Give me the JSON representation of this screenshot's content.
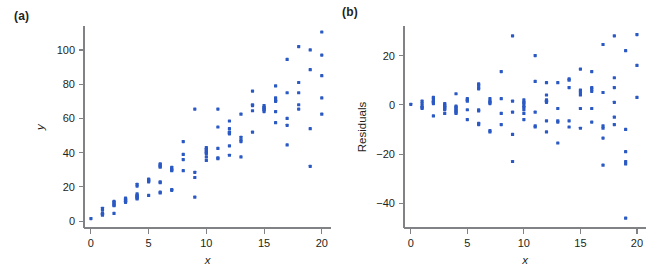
{
  "figure": {
    "background": "#ffffff",
    "marker_color": "#2b59c3",
    "axis_color": "#808285",
    "text_color": "#231f20"
  },
  "panels": [
    {
      "id": "a",
      "label": "(a)",
      "xlabel": "x",
      "ylabel": "y"
    },
    {
      "id": "b",
      "label": "(b)",
      "xlabel": "x",
      "ylabel": "Residuals"
    }
  ],
  "chart_data": [
    {
      "type": "scatter",
      "panel": "(a)",
      "title": "",
      "xlabel": "x",
      "ylabel": "y",
      "xlim": [
        -0.6,
        20.8
      ],
      "ylim": [
        -4,
        114
      ],
      "xticks": [
        0,
        5,
        10,
        15,
        20
      ],
      "yticks": [
        0,
        20,
        40,
        60,
        80,
        100
      ],
      "grid": false,
      "legend": null,
      "points": [
        [
          0,
          1.5
        ],
        [
          1,
          7.5
        ],
        [
          1,
          6.5
        ],
        [
          1,
          4.5
        ],
        [
          1,
          4.0
        ],
        [
          1,
          3.5
        ],
        [
          2,
          11.5
        ],
        [
          2,
          11.0
        ],
        [
          2,
          10.0
        ],
        [
          2,
          9.5
        ],
        [
          2,
          9.0
        ],
        [
          2,
          4.5
        ],
        [
          3,
          13.5
        ],
        [
          3,
          13.0
        ],
        [
          3,
          12.5
        ],
        [
          3,
          12.0
        ],
        [
          3,
          11.5
        ],
        [
          3,
          11.0
        ],
        [
          4,
          21.5
        ],
        [
          4,
          20.5
        ],
        [
          4,
          16.0
        ],
        [
          4,
          15.0
        ],
        [
          4,
          14.5
        ],
        [
          4,
          14.0
        ],
        [
          4,
          13.5
        ],
        [
          4,
          13.0
        ],
        [
          5,
          24.5
        ],
        [
          5,
          24.0
        ],
        [
          5,
          23.5
        ],
        [
          5,
          23.0
        ],
        [
          5,
          15.0
        ],
        [
          6,
          33.5
        ],
        [
          6,
          33.0
        ],
        [
          6,
          32.0
        ],
        [
          6,
          31.5
        ],
        [
          6,
          23.0
        ],
        [
          6,
          22.5
        ],
        [
          6,
          17.0
        ],
        [
          6,
          16.5
        ],
        [
          7,
          31.5
        ],
        [
          7,
          30.5
        ],
        [
          7,
          30.0
        ],
        [
          7,
          29.5
        ],
        [
          7,
          18.5
        ],
        [
          7,
          18.0
        ],
        [
          8,
          46.5
        ],
        [
          8,
          39.0
        ],
        [
          8,
          36.0
        ],
        [
          8,
          29.5
        ],
        [
          9,
          65.5
        ],
        [
          9,
          28.5
        ],
        [
          9,
          25.5
        ],
        [
          9,
          14.0
        ],
        [
          10,
          43.0
        ],
        [
          10,
          42.0
        ],
        [
          10,
          41.5
        ],
        [
          10,
          40.5
        ],
        [
          10,
          40.0
        ],
        [
          10,
          39.5
        ],
        [
          10,
          37.5
        ],
        [
          10,
          35.5
        ],
        [
          11,
          65.5
        ],
        [
          11,
          55.0
        ],
        [
          11,
          42.5
        ],
        [
          11,
          37.0
        ],
        [
          11,
          36.5
        ],
        [
          12,
          58.5
        ],
        [
          12,
          54.0
        ],
        [
          12,
          52.0
        ],
        [
          12,
          51.5
        ],
        [
          12,
          51.0
        ],
        [
          12,
          44.0
        ],
        [
          12,
          38.5
        ],
        [
          13,
          62.5
        ],
        [
          13,
          49.0
        ],
        [
          13,
          47.5
        ],
        [
          13,
          46.5
        ],
        [
          13,
          37.5
        ],
        [
          14,
          76.0
        ],
        [
          14,
          68.0
        ],
        [
          14,
          67.5
        ],
        [
          14,
          64.5
        ],
        [
          14,
          52.0
        ],
        [
          15,
          67.5
        ],
        [
          15,
          66.5
        ],
        [
          15,
          66.0
        ],
        [
          15,
          65.5
        ],
        [
          15,
          65.0
        ],
        [
          15,
          64.0
        ],
        [
          16,
          79.0
        ],
        [
          16,
          72.0
        ],
        [
          16,
          70.5
        ],
        [
          16,
          70.0
        ],
        [
          16,
          64.0
        ],
        [
          16,
          57.5
        ],
        [
          17,
          94.5
        ],
        [
          17,
          75.0
        ],
        [
          17,
          60.0
        ],
        [
          17,
          56.0
        ],
        [
          17,
          44.5
        ],
        [
          18,
          102.0
        ],
        [
          18,
          81.0
        ],
        [
          18,
          75.0
        ],
        [
          18,
          68.0
        ],
        [
          18,
          65.5
        ],
        [
          19,
          100.0
        ],
        [
          19,
          88.5
        ],
        [
          19,
          54.0
        ],
        [
          19,
          32.0
        ],
        [
          20,
          110.5
        ],
        [
          20,
          97.0
        ],
        [
          20,
          85.0
        ],
        [
          20,
          72.0
        ],
        [
          20,
          62.5
        ]
      ]
    },
    {
      "type": "scatter",
      "panel": "(b)",
      "title": "",
      "xlabel": "x",
      "ylabel": "Residuals",
      "xlim": [
        -0.6,
        20.8
      ],
      "ylim": [
        -50,
        32
      ],
      "xticks": [
        0,
        5,
        10,
        15,
        20
      ],
      "yticks": [
        -40,
        -20,
        0,
        20
      ],
      "grid": false,
      "legend": null,
      "points": [
        [
          0,
          0.2
        ],
        [
          1,
          1.5
        ],
        [
          1,
          0.5
        ],
        [
          1,
          -0.5
        ],
        [
          1,
          -1.0
        ],
        [
          1,
          -1.5
        ],
        [
          2,
          3.0
        ],
        [
          2,
          2.5
        ],
        [
          2,
          1.5
        ],
        [
          2,
          1.0
        ],
        [
          2,
          0.5
        ],
        [
          2,
          -4.5
        ],
        [
          3,
          0.5
        ],
        [
          3,
          0.0
        ],
        [
          3,
          -0.5
        ],
        [
          3,
          -1.0
        ],
        [
          3,
          -1.5
        ],
        [
          3,
          -2.0
        ],
        [
          3,
          -3.5
        ],
        [
          4,
          4.5
        ],
        [
          4,
          -0.5
        ],
        [
          4,
          -1.0
        ],
        [
          4,
          -1.5
        ],
        [
          4,
          -2.0
        ],
        [
          4,
          -2.5
        ],
        [
          4,
          -3.0
        ],
        [
          4,
          -3.5
        ],
        [
          5,
          2.5
        ],
        [
          5,
          2.0
        ],
        [
          5,
          1.5
        ],
        [
          5,
          -2.0
        ],
        [
          5,
          -6.0
        ],
        [
          6,
          8.5
        ],
        [
          6,
          8.0
        ],
        [
          6,
          7.0
        ],
        [
          6,
          6.5
        ],
        [
          6,
          -2.0
        ],
        [
          6,
          -2.5
        ],
        [
          6,
          -7.5
        ],
        [
          6,
          -8.0
        ],
        [
          7,
          2.5
        ],
        [
          7,
          1.5
        ],
        [
          7,
          1.0
        ],
        [
          7,
          0.5
        ],
        [
          7,
          -10.5
        ],
        [
          7,
          -11.0
        ],
        [
          8,
          13.5
        ],
        [
          8,
          2.5
        ],
        [
          8,
          -3.5
        ],
        [
          8,
          -8.0
        ],
        [
          9,
          28.0
        ],
        [
          9,
          1.5
        ],
        [
          9,
          -3.0
        ],
        [
          9,
          -12.0
        ],
        [
          9,
          -23.0
        ],
        [
          10,
          2.0
        ],
        [
          10,
          1.0
        ],
        [
          10,
          0.5
        ],
        [
          10,
          -0.5
        ],
        [
          10,
          -1.0
        ],
        [
          10,
          -2.0
        ],
        [
          10,
          -3.5
        ],
        [
          10,
          -6.0
        ],
        [
          11,
          20.0
        ],
        [
          11,
          9.5
        ],
        [
          11,
          -3.0
        ],
        [
          11,
          -8.5
        ],
        [
          11,
          -9.0
        ],
        [
          12,
          9.0
        ],
        [
          12,
          4.0
        ],
        [
          12,
          2.0
        ],
        [
          12,
          1.5
        ],
        [
          12,
          1.0
        ],
        [
          12,
          -6.5
        ],
        [
          12,
          -11.0
        ],
        [
          13,
          9.0
        ],
        [
          13,
          -1.5
        ],
        [
          13,
          -6.5
        ],
        [
          13,
          -7.0
        ],
        [
          13,
          -15.5
        ],
        [
          14,
          10.5
        ],
        [
          14,
          10.0
        ],
        [
          14,
          7.0
        ],
        [
          14,
          -6.5
        ],
        [
          14,
          -9.0
        ],
        [
          15,
          14.5
        ],
        [
          15,
          6.0
        ],
        [
          15,
          5.0
        ],
        [
          15,
          4.0
        ],
        [
          15,
          -1.5
        ],
        [
          15,
          -9.5
        ],
        [
          16,
          13.5
        ],
        [
          16,
          7.0
        ],
        [
          16,
          6.5
        ],
        [
          16,
          5.5
        ],
        [
          16,
          -1.5
        ],
        [
          16,
          -7.0
        ],
        [
          17,
          24.5
        ],
        [
          17,
          5.0
        ],
        [
          17,
          -8.5
        ],
        [
          17,
          -9.5
        ],
        [
          17,
          -13.5
        ],
        [
          17,
          -24.5
        ],
        [
          18,
          28.0
        ],
        [
          18,
          11.0
        ],
        [
          18,
          7.0
        ],
        [
          18,
          1.0
        ],
        [
          18,
          -5.0
        ],
        [
          18,
          -8.0
        ],
        [
          19,
          22.0
        ],
        [
          19,
          -10.0
        ],
        [
          19,
          -19.0
        ],
        [
          19,
          -23.0
        ],
        [
          19,
          -24.0
        ],
        [
          19,
          -46.0
        ],
        [
          20,
          28.5
        ],
        [
          20,
          16.0
        ],
        [
          20,
          3.0
        ]
      ]
    }
  ]
}
